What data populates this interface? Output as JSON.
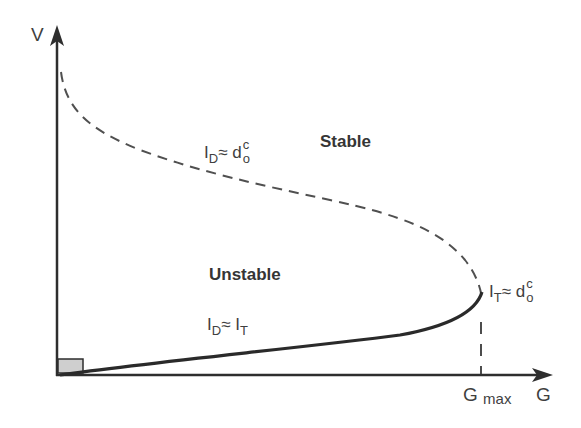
{
  "diagram": {
    "axes": {
      "y_label": "V",
      "x_label": "G",
      "x_tick_label_main": "G",
      "x_tick_label_sub": "max"
    },
    "regions": {
      "stable": "Stable",
      "unstable": "Unstable"
    },
    "annotations": {
      "dashed_curve": {
        "lhs": "I",
        "lhs_sub": "D",
        "approx": "≈",
        "rhs": "d",
        "rhs_sup": "c",
        "rhs_sub": "o"
      },
      "solid_curve": {
        "lhs": "I",
        "lhs_sub": "D",
        "approx": "≈",
        "rhs": "I",
        "rhs_sub": "T"
      },
      "turning_point": {
        "lhs": "I",
        "lhs_sub": "T",
        "approx": "≈",
        "rhs": "d",
        "rhs_sup": "c",
        "rhs_sub": "o"
      }
    },
    "colors": {
      "line": "#2e2e2e",
      "dashed": "#505050",
      "box_fill": "#cfcfcf"
    }
  }
}
